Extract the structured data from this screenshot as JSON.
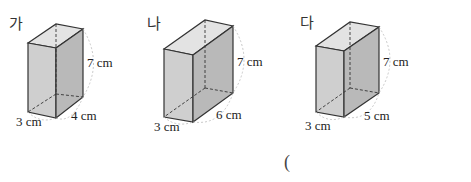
{
  "figures": [
    {
      "label": "가",
      "height_label": "7 cm",
      "width_label": "3 cm",
      "depth_label": "4 cm"
    },
    {
      "label": "나",
      "height_label": "7 cm",
      "width_label": "3 cm",
      "depth_label": "6 cm"
    },
    {
      "label": "다",
      "height_label": "7 cm",
      "width_label": "3 cm",
      "depth_label": "5 cm"
    }
  ],
  "answer": {
    "open_paren": "("
  },
  "colors": {
    "front_face": "#cfcfcf",
    "side_face": "#b9b9b9",
    "top_face": "#e3e3e3",
    "edge": "#333333",
    "arc": "#bbbbbb"
  }
}
